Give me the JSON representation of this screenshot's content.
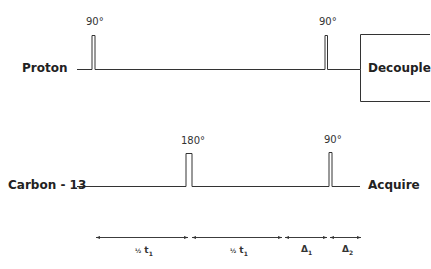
{
  "channels": {
    "proton": {
      "label": "Proton",
      "pulses": [
        {
          "angle": "90°"
        },
        {
          "angle": "90°"
        }
      ],
      "end_block": "Decouple"
    },
    "carbon": {
      "label": "Carbon - 13",
      "pulses": [
        {
          "angle": "180°"
        },
        {
          "angle": "90°"
        }
      ],
      "end_label": "Acquire"
    }
  },
  "intervals": [
    {
      "prefix": "½",
      "symbol": "t",
      "sub": "1"
    },
    {
      "prefix": "½",
      "symbol": "t",
      "sub": "1"
    },
    {
      "prefix": "",
      "symbol": "Δ",
      "sub": "1"
    },
    {
      "prefix": "",
      "symbol": "Δ",
      "sub": "2"
    }
  ],
  "colors": {
    "line": "#333333",
    "background": "#ffffff"
  }
}
